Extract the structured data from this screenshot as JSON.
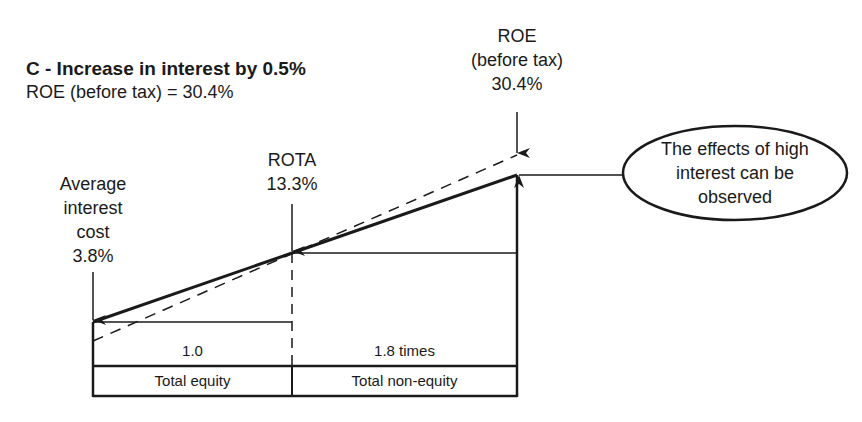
{
  "heading": {
    "title": "C - Increase in interest by 0.5%",
    "subtitle": "ROE (before tax) = 30.4%"
  },
  "labels": {
    "interest": {
      "line1": "Average",
      "line2": "interest",
      "line3": "cost",
      "value": "3.8%"
    },
    "rota": {
      "line1": "ROTA",
      "value": "13.3%"
    },
    "roe": {
      "line1": "ROE",
      "line2": "(before tax)",
      "value": "30.4%"
    }
  },
  "callout": {
    "line1": "The effects of high",
    "line2": "interest can be",
    "line3": "observed"
  },
  "table": {
    "ratios": [
      "1.0",
      "1.8 times"
    ],
    "categories": [
      "Total equity",
      "Total non-equity"
    ]
  },
  "colors": {
    "ink": "#1a1a1a",
    "background": "#ffffff"
  },
  "diagram_values": {
    "average_interest_cost_pct": 3.8,
    "rota_pct": 13.3,
    "roe_before_tax_pct": 30.4,
    "equity_ratio": 1.0,
    "non_equity_ratio": 1.8,
    "interest_increase_pct": 0.5
  }
}
